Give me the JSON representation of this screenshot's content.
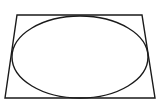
{
  "diagram": {
    "background": "#ffffff",
    "stroke_color": "#1a1a1a",
    "stroke_width": 1.4,
    "trapezoid": {
      "points": [
        [
          17,
          15
        ],
        [
          142,
          15
        ],
        [
          155,
          98
        ],
        [
          5,
          98
        ]
      ]
    },
    "ellipse": {
      "cx": 80,
      "cy": 57,
      "rx": 68,
      "ry": 41
    }
  }
}
